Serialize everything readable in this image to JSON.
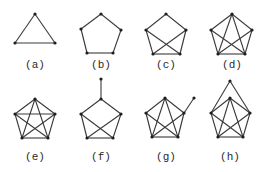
{
  "figure": {
    "type": "graph-panel-grid",
    "rows": 2,
    "columns": 4,
    "colors": {
      "edge": "#3a3a3a",
      "vertex": "#1e1e1e",
      "label": "#2a2a2a",
      "background": "#ffffff"
    }
  },
  "panels": [
    {
      "id": "a",
      "label": "(a)",
      "label_pos": [
        35,
        68
      ],
      "vertices": [
        [
          35,
          14
        ],
        [
          15,
          43
        ],
        [
          55,
          43
        ]
      ],
      "edges": [
        [
          0,
          1
        ],
        [
          1,
          2
        ],
        [
          2,
          0
        ]
      ]
    },
    {
      "id": "b",
      "label": "(b)",
      "label_pos": [
        101,
        68
      ],
      "vertices": [
        [
          101,
          14
        ],
        [
          81,
          29
        ],
        [
          121,
          30
        ],
        [
          87,
          53
        ],
        [
          113,
          53
        ]
      ],
      "edges": [
        [
          0,
          1
        ],
        [
          1,
          3
        ],
        [
          3,
          4
        ],
        [
          4,
          2
        ],
        [
          2,
          0
        ]
      ]
    },
    {
      "id": "c",
      "label": "(c)",
      "label_pos": [
        166,
        68
      ],
      "vertices": [
        [
          166,
          14
        ],
        [
          146,
          30
        ],
        [
          186,
          30
        ],
        [
          153,
          54
        ],
        [
          180,
          54
        ]
      ],
      "edges": [
        [
          0,
          1
        ],
        [
          1,
          3
        ],
        [
          3,
          4
        ],
        [
          4,
          2
        ],
        [
          2,
          0
        ],
        [
          1,
          4
        ],
        [
          2,
          3
        ]
      ]
    },
    {
      "id": "d",
      "label": "(d)",
      "label_pos": [
        232,
        68
      ],
      "vertices": [
        [
          232,
          14
        ],
        [
          211,
          30
        ],
        [
          252,
          30
        ],
        [
          218,
          54
        ],
        [
          245,
          54
        ]
      ],
      "edges": [
        [
          0,
          1
        ],
        [
          1,
          3
        ],
        [
          3,
          4
        ],
        [
          4,
          2
        ],
        [
          2,
          0
        ],
        [
          0,
          3
        ],
        [
          0,
          4
        ],
        [
          1,
          4
        ],
        [
          2,
          3
        ]
      ]
    },
    {
      "id": "e",
      "label": "(e)",
      "label_pos": [
        35,
        160
      ],
      "vertices": [
        [
          35,
          99
        ],
        [
          15,
          114
        ],
        [
          55,
          114
        ],
        [
          22,
          138
        ],
        [
          48,
          138
        ]
      ],
      "edges": [
        [
          0,
          1
        ],
        [
          1,
          3
        ],
        [
          3,
          4
        ],
        [
          4,
          2
        ],
        [
          2,
          0
        ],
        [
          0,
          3
        ],
        [
          0,
          4
        ],
        [
          1,
          2
        ],
        [
          1,
          4
        ],
        [
          2,
          3
        ]
      ]
    },
    {
      "id": "f",
      "label": "(f)",
      "label_pos": [
        101,
        160
      ],
      "vertices": [
        [
          101,
          99
        ],
        [
          81,
          114
        ],
        [
          121,
          114
        ],
        [
          87,
          138
        ],
        [
          113,
          138
        ],
        [
          101,
          79
        ]
      ],
      "edges": [
        [
          0,
          1
        ],
        [
          1,
          3
        ],
        [
          3,
          4
        ],
        [
          4,
          2
        ],
        [
          2,
          0
        ],
        [
          1,
          4
        ],
        [
          2,
          3
        ],
        [
          0,
          5
        ]
      ]
    },
    {
      "id": "g",
      "label": "(g)",
      "label_pos": [
        166,
        160
      ],
      "vertices": [
        [
          165,
          98
        ],
        [
          146,
          113
        ],
        [
          184,
          113
        ],
        [
          152,
          137
        ],
        [
          178,
          137
        ],
        [
          194,
          98
        ]
      ],
      "edges": [
        [
          0,
          1
        ],
        [
          1,
          3
        ],
        [
          3,
          4
        ],
        [
          4,
          2
        ],
        [
          2,
          0
        ],
        [
          0,
          3
        ],
        [
          0,
          4
        ],
        [
          1,
          4
        ],
        [
          2,
          3
        ],
        [
          2,
          5
        ]
      ]
    },
    {
      "id": "h",
      "label": "(h)",
      "label_pos": [
        230,
        160
      ],
      "vertices": [
        [
          230,
          98
        ],
        [
          211,
          113
        ],
        [
          250,
          113
        ],
        [
          218,
          137
        ],
        [
          243,
          137
        ],
        [
          230,
          81
        ]
      ],
      "edges": [
        [
          0,
          1
        ],
        [
          1,
          3
        ],
        [
          3,
          4
        ],
        [
          4,
          2
        ],
        [
          2,
          0
        ],
        [
          0,
          3
        ],
        [
          0,
          4
        ],
        [
          1,
          4
        ],
        [
          2,
          3
        ],
        [
          5,
          1
        ],
        [
          5,
          2
        ]
      ]
    }
  ]
}
